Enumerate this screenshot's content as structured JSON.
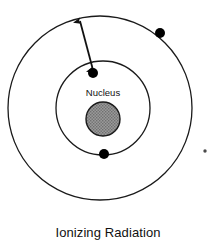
{
  "figure": {
    "caption": "Ionizing Radiation",
    "nucleus_label": "Nucleus",
    "colors": {
      "stroke": "#1a1a1a",
      "nucleus_fill": "#8c8c8c",
      "electron_fill": "#000000",
      "background": "#ffffff",
      "ejected_electron_fill": "#4a4a4a"
    },
    "geometry": {
      "outer_shell": {
        "cx": 100,
        "cy": 108,
        "r": 92,
        "name": "outer-electron-shell"
      },
      "inner_shell": {
        "cx": 103,
        "cy": 108,
        "r": 47,
        "name": "inner-electron-shell"
      },
      "nucleus": {
        "cx": 103,
        "cy": 119,
        "r": 17
      },
      "electrons": [
        {
          "name": "electron-outer-upper-right",
          "cx": 160,
          "cy": 33,
          "r": 5
        },
        {
          "name": "electron-inner-upper-left",
          "cx": 93,
          "cy": 73,
          "r": 5
        },
        {
          "name": "electron-inner-bottom",
          "cx": 104,
          "cy": 154,
          "r": 5
        }
      ],
      "ejected_electron": {
        "name": "electron-ejected",
        "cx": 205,
        "cy": 151,
        "r": 1.6
      },
      "radiation_arrow": {
        "name": "radiation-arrow",
        "x1": 93,
        "y1": 71,
        "x2": 79,
        "y2": 18,
        "double_headed": true
      }
    }
  }
}
